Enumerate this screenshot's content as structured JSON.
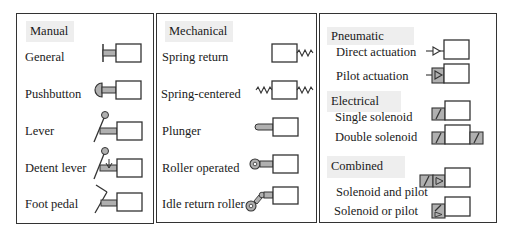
{
  "panels": [
    {
      "heading": "Manual",
      "items": [
        {
          "label": "General",
          "symbol": "general-manual-icon"
        },
        {
          "label": "Pushbutton",
          "symbol": "pushbutton-icon"
        },
        {
          "label": "Lever",
          "symbol": "lever-icon"
        },
        {
          "label": "Detent lever",
          "symbol": "detent-lever-icon"
        },
        {
          "label": "Foot pedal",
          "symbol": "foot-pedal-icon"
        }
      ]
    },
    {
      "heading": "Mechanical",
      "items": [
        {
          "label": "Spring return",
          "symbol": "spring-return-icon"
        },
        {
          "label": "Spring-centered",
          "symbol": "spring-centered-icon"
        },
        {
          "label": "Plunger",
          "symbol": "plunger-icon"
        },
        {
          "label": "Roller operated",
          "symbol": "roller-operated-icon"
        },
        {
          "label": "Idle return roller",
          "symbol": "idle-return-roller-icon"
        }
      ]
    },
    {
      "sections": [
        {
          "heading": "Pneumatic",
          "items": [
            {
              "label": "Direct actuation",
              "symbol": "direct-actuation-icon"
            },
            {
              "label": "Pilot actuation",
              "symbol": "pilot-actuation-icon"
            }
          ]
        },
        {
          "heading": "Electrical",
          "items": [
            {
              "label": "Single solenoid",
              "symbol": "single-solenoid-icon"
            },
            {
              "label": "Double solenoid",
              "symbol": "double-solenoid-icon"
            }
          ]
        },
        {
          "heading": "Combined",
          "items": [
            {
              "label": "Solenoid and pilot",
              "symbol": "solenoid-and-pilot-icon"
            },
            {
              "label": "Solenoid or pilot",
              "symbol": "solenoid-or-pilot-icon"
            }
          ]
        }
      ]
    }
  ],
  "colors": {
    "line": "#333333",
    "fill_gray": "#b0b0b0",
    "heading_bg": "#eeeeee"
  }
}
